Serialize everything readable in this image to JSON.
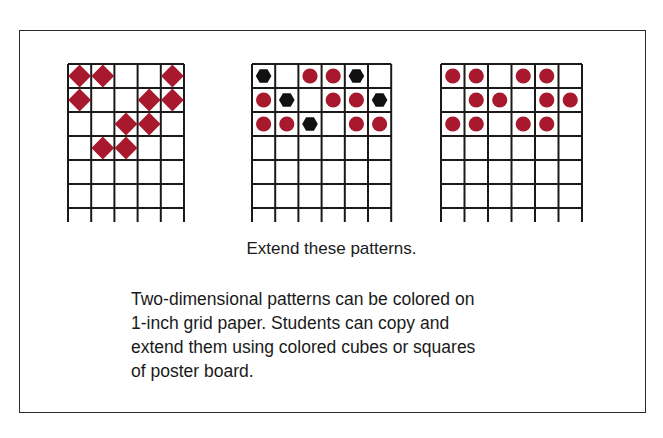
{
  "colors": {
    "red": "#a8192e",
    "black": "#111111",
    "grid_line": "#1a1a1a"
  },
  "grids": [
    {
      "id": "diamond-pattern",
      "x": 68,
      "columns": 5,
      "rows": 6,
      "cell_w": 23.2,
      "cell_h": 24,
      "cells": [
        [
          "diamond",
          "diamond",
          null,
          null,
          "diamond"
        ],
        [
          "diamond",
          null,
          null,
          "diamond",
          "diamond"
        ],
        [
          null,
          null,
          "diamond",
          "diamond",
          null
        ],
        [
          null,
          "diamond",
          "diamond",
          null,
          null
        ]
      ]
    },
    {
      "id": "circle-hexagon-pattern",
      "x": 252,
      "columns": 6,
      "rows": 6,
      "cell_w": 23.2,
      "cell_h": 24,
      "cells": [
        [
          "hexagon",
          null,
          "circle",
          "circle",
          "hexagon",
          null
        ],
        [
          "circle",
          "hexagon",
          null,
          "circle",
          "circle",
          "hexagon"
        ],
        [
          "circle",
          "circle",
          "hexagon",
          null,
          "circle",
          "circle"
        ]
      ]
    },
    {
      "id": "circle-pattern",
      "x": 441,
      "columns": 6,
      "rows": 6,
      "cell_w": 23.5,
      "cell_h": 24,
      "cells": [
        [
          "circle",
          "circle",
          null,
          "circle",
          "circle",
          null
        ],
        [
          null,
          "circle",
          "circle",
          null,
          "circle",
          "circle"
        ],
        [
          "circle",
          "circle",
          null,
          "circle",
          "circle",
          null
        ]
      ]
    }
  ],
  "caption": "Extend these patterns.",
  "description": {
    "lines": [
      "Two-dimensional patterns can be colored on",
      "1-inch grid paper. Students can copy and",
      "extend them using colored cubes or squares",
      "of poster board."
    ]
  }
}
